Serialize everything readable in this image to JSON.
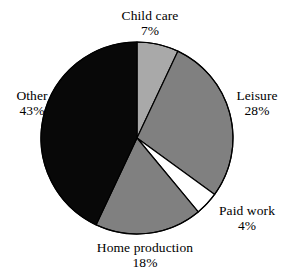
{
  "chart_data": {
    "type": "pie",
    "title": "",
    "subtitle": "",
    "xlabel": "",
    "ylabel": "",
    "legend_position": "none",
    "grid": false,
    "start_angle_deg": 0,
    "direction": "clockwise",
    "units": "percent",
    "categories": [
      "Child care",
      "Leisure",
      "Paid work",
      "Home production",
      "Other"
    ],
    "values": [
      7,
      28,
      4,
      18,
      43
    ],
    "value_labels": [
      "7%",
      "28%",
      "4%",
      "18%",
      "43%"
    ],
    "colors": [
      "#a9a9a9",
      "#808080",
      "#ffffff",
      "#808080",
      "#080808"
    ],
    "slices": [
      {
        "label": "Child care",
        "value": 7,
        "value_label": "7%",
        "color": "#a9a9a9",
        "stroke": "#000000"
      },
      {
        "label": "Leisure",
        "value": 28,
        "value_label": "28%",
        "color": "#808080",
        "stroke": "#000000"
      },
      {
        "label": "Paid work",
        "value": 4,
        "value_label": "4%",
        "color": "#ffffff",
        "stroke": "#000000"
      },
      {
        "label": "Home production",
        "value": 18,
        "value_label": "18%",
        "color": "#808080",
        "stroke": "#000000"
      },
      {
        "label": "Other",
        "value": 43,
        "value_label": "43%",
        "color": "#080808",
        "stroke": "#000000"
      }
    ],
    "total": 100
  },
  "labels": {
    "child_care": {
      "name": "Child care",
      "value": "7%"
    },
    "leisure": {
      "name": "Leisure",
      "value": "28%"
    },
    "paid_work": {
      "name": "Paid work",
      "value": "4%"
    },
    "home_production": {
      "name": "Home production",
      "value": "18%"
    },
    "other": {
      "name": "Other",
      "value": "43%"
    }
  },
  "geometry": {
    "center_x": 137,
    "center_y": 138,
    "radius": 96
  },
  "style": {
    "background": "#ffffff",
    "outline": "#000000",
    "text": "#000000"
  }
}
